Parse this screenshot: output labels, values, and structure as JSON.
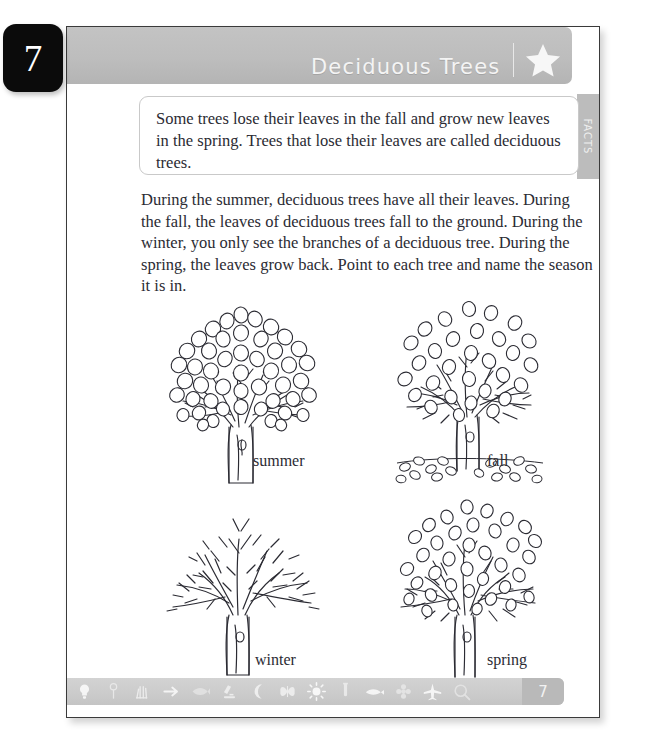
{
  "chapter": {
    "number": "7"
  },
  "header": {
    "title": "Deciduous Trees",
    "star_icon": "star-icon"
  },
  "facts": {
    "tab_label": "FACTS",
    "text": "Some trees lose their leaves in the fall and grow new leaves in the spring. Trees that lose their leaves are called deciduous trees."
  },
  "body": {
    "paragraph": "During the summer, deciduous trees have all their leaves. During the fall, the leaves of deciduous trees fall to the ground. During the winter, you only see the branches of a deciduous tree. During the spring, the leaves grow back. Point to each tree and name the season it is in."
  },
  "trees": [
    {
      "label": "summer",
      "state": "full-leaves",
      "name": "tree-illustration-summer"
    },
    {
      "label": "fall",
      "state": "leaves-falling",
      "name": "tree-illustration-fall"
    },
    {
      "label": "winter",
      "state": "bare-branches",
      "name": "tree-illustration-winter"
    },
    {
      "label": "spring",
      "state": "new-buds",
      "name": "tree-illustration-spring"
    }
  ],
  "footer": {
    "page_number": "7",
    "icons": [
      "lightbulb-icon",
      "plant-icon",
      "arrow-icon",
      "fish-icon",
      "microscope-icon",
      "moon-icon",
      "butterfly-icon",
      "sun-icon",
      "test-tube-icon",
      "whale-icon",
      "flower-icon",
      "airplane-icon",
      "magnifier-icon"
    ]
  },
  "colors": {
    "band_gray": "#bdbdbd",
    "footer_gray": "#cbcbcb",
    "badge_black": "#0b0b0b",
    "text_ink": "#2b2b33"
  }
}
